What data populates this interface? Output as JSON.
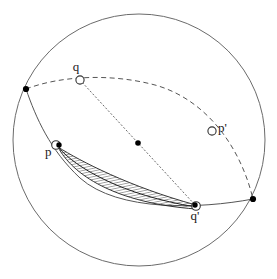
{
  "figure": {
    "background_color": "#ffffff",
    "stroke_color": "#4d4d4d",
    "dark_stroke_color": "#1a1a1a",
    "marker_fill": "#000000",
    "hatch_color": "#333333",
    "width": 277,
    "height": 279
  },
  "outer_circle": {
    "name": "sphere-outline",
    "cx": 139,
    "cy": 140,
    "r": 126
  },
  "labels": {
    "p": "p",
    "q": "q",
    "p_prime": "p'",
    "q_prime": "q'"
  },
  "points": {
    "p": {
      "x": 58,
      "y": 146,
      "marker": "open-circle-with-dot"
    },
    "q": {
      "x": 80,
      "y": 80,
      "marker": "open-circle"
    },
    "p_prime": {
      "x": 212,
      "y": 131,
      "marker": "open-circle"
    },
    "q_prime": {
      "x": 196,
      "y": 204,
      "marker": "open-circle-with-dot"
    },
    "center": {
      "x": 138,
      "y": 143,
      "marker": "filled-dot"
    },
    "left_node": {
      "x": 26,
      "y": 89,
      "marker": "filled-dot"
    },
    "right_node": {
      "x": 253,
      "y": 199,
      "marker": "filled-dot"
    }
  },
  "curves": {
    "solid_geodesic": {
      "name": "solid-great-circle-arc",
      "style": "solid",
      "path": "M 26 89 C 36 118 50 150 80 178 C 118 212 200 209 253 199"
    },
    "dashed_geodesic": {
      "name": "dashed-great-circle-arc",
      "style": "dashed",
      "path": "M 26 89 C 60 76 110 73 155 85 C 205 99 240 145 253 199"
    },
    "dotted_diameter": {
      "name": "dotted-diameter-line",
      "style": "dotted",
      "path": "M 80 80 L 196 206"
    },
    "lens_upper_edge": {
      "name": "lens-upper-boundary",
      "path": "M 58 147 C 80 161 130 187 196 205"
    },
    "lens_lower_edge": {
      "name": "lens-lower-boundary",
      "path": "M 58 147 C 72 174 114 203 196 209"
    },
    "lens_mid_edge": {
      "name": "lens-midline",
      "path": "M 58 147 C 76 168 122 195 196 207"
    }
  },
  "hatching": {
    "name": "lens-hatch-fill",
    "angle_deg": 78,
    "spacing_px": 2.6,
    "stroke_width": 0.7
  }
}
